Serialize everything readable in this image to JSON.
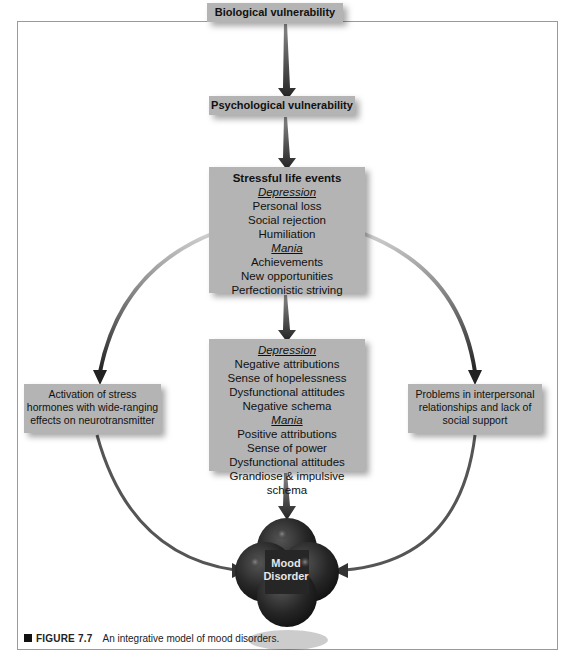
{
  "diagram": {
    "nodes": {
      "biological": {
        "label": "Biological vulnerability"
      },
      "psychological": {
        "label": "Psychological vulnerability"
      },
      "stressful_events": {
        "title": "Stressful life events",
        "depression_heading": "Depression",
        "depression_items": [
          "Personal loss",
          "Social rejection",
          "Humiliation"
        ],
        "mania_heading": "Mania",
        "mania_items": [
          "Achievements",
          "New opportunities",
          "Perfectionistic striving"
        ]
      },
      "cognitive": {
        "depression_heading": "Depression",
        "depression_items": [
          "Negative attributions",
          "Sense of hopelessness",
          "Dysfunctional attitudes",
          "Negative schema"
        ],
        "mania_heading": "Mania",
        "mania_items": [
          "Positive attributions",
          "Sense of power",
          "Dysfunctional attitudes",
          "Grandiose & impulsive schema"
        ]
      },
      "stress_hormones": {
        "lines": [
          "Activation of stress",
          "hormones with wide-ranging",
          "effects on neurotransmitter"
        ]
      },
      "interpersonal": {
        "lines": [
          "Problems in interpersonal",
          "relationships and lack of",
          "social support"
        ]
      },
      "mood_disorder": {
        "lines": [
          "Mood",
          "Disorder"
        ]
      }
    },
    "edges": [
      [
        "biological",
        "psychological"
      ],
      [
        "psychological",
        "stressful_events"
      ],
      [
        "stressful_events",
        "cognitive"
      ],
      [
        "stressful_events",
        "stress_hormones"
      ],
      [
        "stressful_events",
        "interpersonal"
      ],
      [
        "cognitive",
        "mood_disorder"
      ],
      [
        "stress_hormones",
        "mood_disorder"
      ],
      [
        "interpersonal",
        "mood_disorder"
      ]
    ],
    "colors": {
      "box": "#b4b4b4",
      "blob": "#2a2a2a",
      "arrow": "#333333"
    }
  },
  "caption": {
    "figure_label": "FIGURE 7.7",
    "text": "An integrative model of mood disorders."
  }
}
